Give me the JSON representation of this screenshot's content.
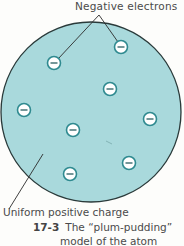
{
  "diagram": {
    "labels": {
      "electrons": "Negative electrons",
      "positive_charge": "Uniform positive charge"
    },
    "caption": {
      "figure_number": "17-3",
      "line1": "The “plum-pudding”",
      "line2": "model of the atom"
    },
    "colors": {
      "sphere_fill": "#a9d9dc",
      "sphere_stroke": "#2a3a3a",
      "electron_fill": "#ffffff",
      "electron_stroke": "#2f8a90",
      "electron_sign": "#3a6b6e"
    },
    "sphere": {
      "cx": 91,
      "cy": 112,
      "r": 90
    },
    "electrons": [
      {
        "x": 54,
        "y": 63,
        "sign": "−"
      },
      {
        "x": 121,
        "y": 47,
        "sign": "−"
      },
      {
        "x": 110,
        "y": 89,
        "sign": "−"
      },
      {
        "x": 24,
        "y": 110,
        "sign": "−"
      },
      {
        "x": 73,
        "y": 130,
        "sign": "−"
      },
      {
        "x": 150,
        "y": 119,
        "sign": "−"
      },
      {
        "x": 129,
        "y": 163,
        "sign": "−"
      },
      {
        "x": 70,
        "y": 174,
        "sign": "−"
      }
    ]
  }
}
